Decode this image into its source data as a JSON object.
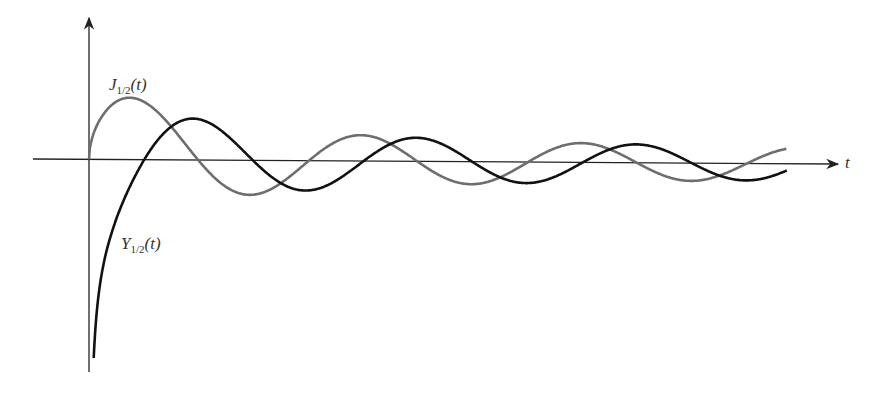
{
  "chart_data": {
    "type": "line",
    "title": "",
    "xlabel": "t",
    "ylabel": "",
    "x_range": [
      0,
      20
    ],
    "y_range": [
      -2.2,
      1.0
    ],
    "grid": false,
    "legend": "inline labels",
    "series": [
      {
        "name": "J_{1/2}(t)",
        "formula": "sqrt(2/(pi t)) sin t",
        "color": "#6e6e6e",
        "points": [
          [
            0,
            0
          ],
          [
            1.17,
            0.61
          ],
          [
            3.14,
            0
          ],
          [
            4.6,
            -0.34
          ],
          [
            6.28,
            0
          ],
          [
            7.79,
            0.28
          ],
          [
            9.42,
            0
          ],
          [
            10.95,
            -0.24
          ],
          [
            12.57,
            0
          ],
          [
            14.1,
            0.21
          ],
          [
            15.71,
            0
          ],
          [
            17.25,
            -0.19
          ],
          [
            18.85,
            0
          ],
          [
            20,
            0.16
          ]
        ]
      },
      {
        "name": "Y_{1/2}(t)",
        "formula": "-sqrt(2/(pi t)) cos t",
        "color": "#111111",
        "points": [
          [
            0.135,
            -2.17
          ],
          [
            1.57,
            0
          ],
          [
            3.14,
            0.45
          ],
          [
            4.71,
            0
          ],
          [
            6.28,
            -0.32
          ],
          [
            7.85,
            0
          ],
          [
            9.42,
            0.26
          ],
          [
            11,
            0
          ],
          [
            12.57,
            -0.22
          ],
          [
            14.14,
            0
          ],
          [
            15.71,
            0.2
          ],
          [
            17.28,
            0
          ],
          [
            18.85,
            -0.18
          ],
          [
            20,
            -0.12
          ]
        ]
      }
    ]
  },
  "labels": {
    "j": {
      "base": "J",
      "sub": "1/2",
      "arg": "(t)"
    },
    "y": {
      "base": "Y",
      "sub": "1/2",
      "arg": "(t)"
    },
    "x_axis": "t"
  }
}
